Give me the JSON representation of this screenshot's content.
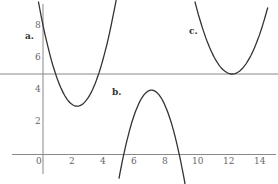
{
  "chart_data": {
    "type": "line",
    "title": "",
    "xlabel": "",
    "ylabel": "",
    "xlim": [
      -0.5,
      15
    ],
    "ylim": [
      -1.5,
      9.5
    ],
    "x_ticks": [
      "0",
      "2",
      "4",
      "6",
      "8",
      "10",
      "12",
      "14"
    ],
    "y_ticks": [
      "2",
      "4",
      "6",
      "8"
    ],
    "grid": false,
    "horizontal_line": {
      "y": 5
    },
    "series": [
      {
        "name": "a.",
        "shape": "upward parabola",
        "vertex": [
          2.2,
          3
        ],
        "points": [
          [
            -0.3,
            9.5
          ],
          [
            0,
            7.5
          ],
          [
            1,
            4.4
          ],
          [
            2.2,
            3
          ],
          [
            3.4,
            4.4
          ],
          [
            4.5,
            7.5
          ],
          [
            4.8,
            9.5
          ]
        ]
      },
      {
        "name": "b.",
        "shape": "downward parabola",
        "vertex": [
          7,
          4
        ],
        "points": [
          [
            4.9,
            -1.5
          ],
          [
            5.2,
            0
          ],
          [
            6,
            2.9
          ],
          [
            7,
            4
          ],
          [
            8,
            2.9
          ],
          [
            9.1,
            0
          ],
          [
            9.4,
            -1.5
          ]
        ]
      },
      {
        "name": "c.",
        "shape": "upward parabola",
        "vertex": [
          12.2,
          5
        ],
        "points": [
          [
            9.8,
            9.5
          ],
          [
            11,
            6.1
          ],
          [
            12.2,
            5
          ],
          [
            13.4,
            6.1
          ],
          [
            14.5,
            9.5
          ]
        ]
      }
    ]
  },
  "labels": {
    "a": "a.",
    "b": "b.",
    "c": "c."
  },
  "colors": {
    "curve": "#333333",
    "axis": "#888888"
  }
}
